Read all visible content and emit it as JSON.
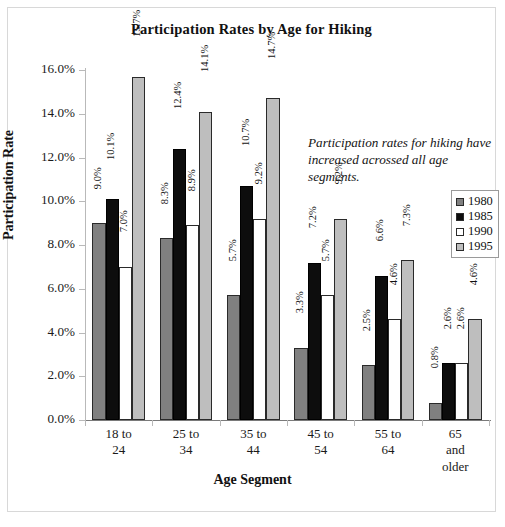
{
  "chart_data": {
    "type": "bar",
    "title": "Participation Rates by Age for Hiking",
    "xlabel": "Age Segment",
    "ylabel": "Participation Rate",
    "categories": [
      "18 to 24",
      "25 to 34",
      "35 to 44",
      "45 to 54",
      "55 to 64",
      "65 and older"
    ],
    "category_lines": [
      [
        "18 to",
        "24"
      ],
      [
        "25 to",
        "34"
      ],
      [
        "35 to",
        "44"
      ],
      [
        "45 to",
        "54"
      ],
      [
        "55 to",
        "64"
      ],
      [
        "65",
        "and",
        "older"
      ]
    ],
    "series": [
      {
        "name": "1980",
        "color": "#808080",
        "values": [
          9.0,
          8.3,
          5.7,
          3.3,
          2.5,
          0.8
        ],
        "labels": [
          "9.0%",
          "8.3%",
          "5.7%",
          "3.3%",
          "2.5%",
          "0.8%"
        ]
      },
      {
        "name": "1985",
        "color": "#0d0d0d",
        "values": [
          10.1,
          12.4,
          10.7,
          7.2,
          6.6,
          2.6
        ],
        "labels": [
          "10.1%",
          "12.4%",
          "10.7%",
          "7.2%",
          "6.6%",
          "2.6%"
        ]
      },
      {
        "name": "1990",
        "color": "#ffffff",
        "values": [
          7.0,
          8.9,
          9.2,
          5.7,
          4.6,
          2.6
        ],
        "labels": [
          "7.0%",
          "8.9%",
          "9.2%",
          "5.7%",
          "4.6%",
          "2.6%"
        ]
      },
      {
        "name": "1995",
        "color": "#bebebe",
        "values": [
          15.7,
          14.1,
          14.7,
          9.2,
          7.3,
          4.6
        ],
        "labels": [
          "15.7%",
          "14.1%",
          "14.7%",
          "9.2%",
          "7.3%",
          "4.6%"
        ]
      }
    ],
    "ylim": [
      0.0,
      16.0
    ],
    "ytick_values": [
      0.0,
      2.0,
      4.0,
      6.0,
      8.0,
      10.0,
      12.0,
      14.0,
      16.0
    ],
    "ytick_labels": [
      "0.0%",
      "2.0%",
      "4.0%",
      "6.0%",
      "8.0%",
      "10.0%",
      "12.0%",
      "14.0%",
      "16.0%"
    ],
    "grid": false,
    "legend_position": "right",
    "legend_entries": [
      "1980",
      "1985",
      "1990",
      "1995"
    ],
    "annotations": [
      {
        "text": "Participation rates for hiking have increased acrossed all age segments.",
        "style": "italic"
      }
    ],
    "data_labels_shown": true,
    "data_label_orientation": "vertical"
  }
}
